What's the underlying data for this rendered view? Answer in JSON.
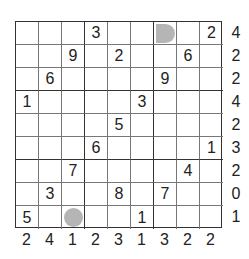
{
  "puzzle": {
    "grid": [
      [
        "",
        "",
        "",
        "3",
        "",
        "",
        "",
        "",
        "2"
      ],
      [
        "",
        "",
        "9",
        "",
        "2",
        "",
        "",
        "6",
        ""
      ],
      [
        "",
        "6",
        "",
        "",
        "",
        "",
        "9",
        "",
        ""
      ],
      [
        "1",
        "",
        "",
        "",
        "",
        "3",
        "",
        "",
        ""
      ],
      [
        "",
        "",
        "",
        "",
        "5",
        "",
        "",
        "",
        ""
      ],
      [
        "",
        "",
        "",
        "6",
        "",
        "",
        "",
        "",
        "1"
      ],
      [
        "",
        "",
        "7",
        "",
        "",
        "",
        "",
        "4",
        ""
      ],
      [
        "",
        "3",
        "",
        "",
        "8",
        "",
        "7",
        "",
        ""
      ],
      [
        "5",
        "",
        "",
        "",
        "",
        "1",
        "",
        "",
        ""
      ]
    ],
    "markers": [
      {
        "row": 0,
        "col": 6,
        "type": "gray-circle"
      },
      {
        "row": 8,
        "col": 2,
        "type": "gray-circle"
      }
    ],
    "row_clues": [
      "4",
      "2",
      "2",
      "4",
      "2",
      "3",
      "2",
      "0",
      "1"
    ],
    "col_clues": [
      "2",
      "4",
      "1",
      "2",
      "3",
      "1",
      "3",
      "2",
      "2"
    ],
    "colors": {
      "marker": "#b5b5b5",
      "grid_line": "#333333"
    }
  }
}
